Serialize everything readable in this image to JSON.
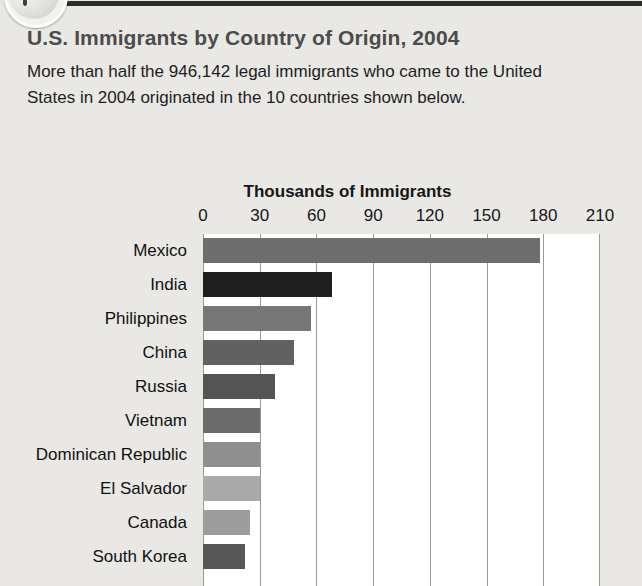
{
  "header": {
    "globe_icon": "globe-icon",
    "rule": "decorative-rule"
  },
  "article": {
    "title": "U.S. Immigrants by Country of Origin, 2004",
    "intro": "More than half the 946,142 legal immigrants who came to the United States in 2004 originated in the 10 countries shown below."
  },
  "chart_data": {
    "type": "bar",
    "orientation": "horizontal",
    "title": "Thousands of Immigrants",
    "xlabel": "Thousands of Immigrants",
    "ylabel": "",
    "xlim": [
      0,
      210
    ],
    "xticks": [
      0,
      30,
      60,
      90,
      120,
      150,
      180,
      210
    ],
    "xtick_labels": [
      "0",
      "30",
      "60",
      "90",
      "120",
      "150",
      "180",
      "210"
    ],
    "grid": true,
    "legend": "none",
    "units": "thousands of immigrants",
    "categories": [
      "Mexico",
      "India",
      "Philippines",
      "China",
      "Russia",
      "Vietnam",
      "Dominican Republic",
      "El Salvador",
      "Canada",
      "South Korea"
    ],
    "values": [
      178,
      68,
      57,
      48,
      38,
      30,
      30,
      30,
      25,
      22
    ],
    "bar_colors": [
      "#6e6e6e",
      "#1f1f1f",
      "#777777",
      "#616161",
      "#545454",
      "#6b6b6b",
      "#8f8f8f",
      "#aaaaaa",
      "#9c9c9c",
      "#575757"
    ]
  },
  "colors": {
    "page_background": "#e9e8e4",
    "title_text": "#4c4c4c",
    "body_text": "#1d1d1d",
    "plot_background": "#ffffff",
    "gridline": "#9a9a9a",
    "rule": "#2c2c2c"
  }
}
